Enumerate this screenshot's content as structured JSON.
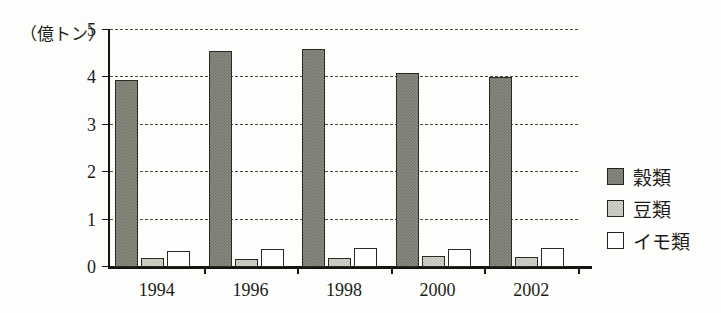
{
  "chart_data": {
    "type": "bar",
    "title": "",
    "subtitle": "",
    "unit_label": "（億トン）",
    "xlabel": "",
    "ylabel": "",
    "ylim": [
      0,
      5
    ],
    "yticks": [
      0,
      1,
      2,
      3,
      4,
      5
    ],
    "ytick_labels": [
      "0",
      "1",
      "2",
      "3",
      "4",
      "5"
    ],
    "grid": true,
    "grid_style": "dashed-horizontal",
    "legend_position": "right",
    "categories": [
      "1994",
      "1996",
      "1998",
      "2000",
      "2002"
    ],
    "series": [
      {
        "name": "穀類",
        "fill": "dark-gray-dither",
        "color": "#7c7c72",
        "values": [
          3.95,
          4.55,
          4.6,
          4.1,
          4.0
        ]
      },
      {
        "name": "豆類",
        "fill": "light-gray-dither",
        "color": "#cdcdc4",
        "values": [
          0.2,
          0.17,
          0.2,
          0.23,
          0.22
        ]
      },
      {
        "name": "イモ類",
        "fill": "white",
        "color": "#ffffff",
        "values": [
          0.33,
          0.37,
          0.4,
          0.38,
          0.4
        ]
      }
    ]
  },
  "colors": {
    "background": "#fdfdfb",
    "axis": "#15150f",
    "grid": "#4a4a40",
    "text": "#1c1c1a"
  }
}
